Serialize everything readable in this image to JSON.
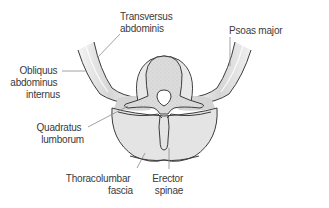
{
  "figure": {
    "labels": {
      "transversus_abdominis": [
        "Transversus",
        "abdominis"
      ],
      "obliquus_abdominus_internus": [
        "Obliquus",
        "abdominus",
        "internus"
      ],
      "psoas_major": [
        "Psoas major"
      ],
      "quadratus_lumborum": [
        "Quadratus",
        "lumborum"
      ],
      "thoracolumbar_fascia": [
        "Thoracolumbar",
        "fascia"
      ],
      "erector_spinae": [
        "Erector",
        "spinae"
      ]
    },
    "colors": {
      "outline": "#3c3c3c",
      "muscle_fill": "#e6e6e6",
      "bone_fill": "#d8d8d8",
      "fascia_fill": "#f2f2f2",
      "leader": "#8a8a8a",
      "text": "#3a3a3a"
    }
  }
}
